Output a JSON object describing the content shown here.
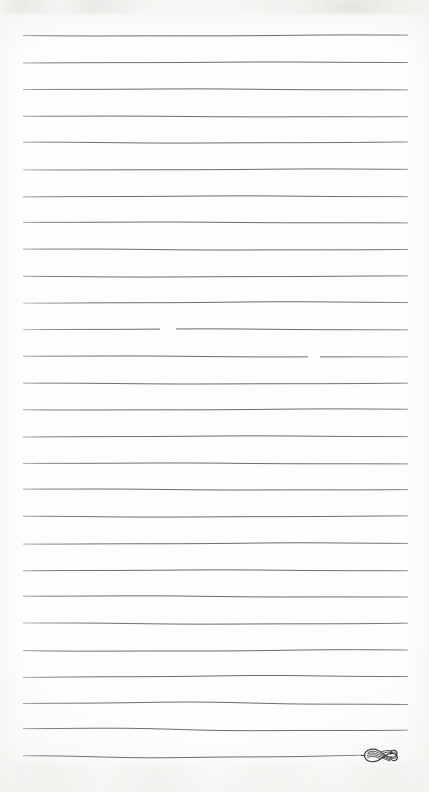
{
  "document": {
    "kind": "scanned-ruled-notepaper",
    "title": "Blank Ruled Notepaper Page",
    "page_width": 429,
    "page_height": 792,
    "background_color": "#fdfdfc",
    "paper_tint_color": "#f6f5f3",
    "text_content": "",
    "has_handwriting": false,
    "has_printed_text": false
  },
  "rules": {
    "count": 28,
    "color": "#585858",
    "stroke_width": 0.9,
    "left_x": 23,
    "right_x": 408,
    "first_y": 35,
    "spacing": 26.7,
    "lines": [
      {
        "index": 1,
        "y": 35,
        "left_x": 23,
        "right_x": 408,
        "wave": 0.5,
        "fade_left": 0.55,
        "fade_right": 0.7,
        "gap": null
      },
      {
        "index": 2,
        "y": 62,
        "left_x": 23,
        "right_x": 408,
        "wave": 0.4,
        "fade_left": 0.55,
        "fade_right": 0.7,
        "gap": null
      },
      {
        "index": 3,
        "y": 89,
        "left_x": 23,
        "right_x": 408,
        "wave": 0.5,
        "fade_left": 0.5,
        "fade_right": 0.7,
        "gap": null
      },
      {
        "index": 4,
        "y": 116,
        "left_x": 23,
        "right_x": 408,
        "wave": 0.4,
        "fade_left": 0.55,
        "fade_right": 0.65,
        "gap": null
      },
      {
        "index": 5,
        "y": 142,
        "left_x": 23,
        "right_x": 408,
        "wave": 0.5,
        "fade_left": 0.55,
        "fade_right": 0.7,
        "gap": null
      },
      {
        "index": 6,
        "y": 169,
        "left_x": 23,
        "right_x": 408,
        "wave": 0.45,
        "fade_left": 0.45,
        "fade_right": 0.7,
        "gap": null
      },
      {
        "index": 7,
        "y": 196,
        "left_x": 23,
        "right_x": 408,
        "wave": 0.5,
        "fade_left": 0.55,
        "fade_right": 0.7,
        "gap": null
      },
      {
        "index": 8,
        "y": 222,
        "left_x": 23,
        "right_x": 408,
        "wave": 0.4,
        "fade_left": 0.55,
        "fade_right": 0.7,
        "gap": null
      },
      {
        "index": 9,
        "y": 249,
        "left_x": 23,
        "right_x": 408,
        "wave": 0.5,
        "fade_left": 0.55,
        "fade_right": 0.7,
        "gap": null
      },
      {
        "index": 10,
        "y": 276,
        "left_x": 23,
        "right_x": 408,
        "wave": 0.45,
        "fade_left": 0.55,
        "fade_right": 0.7,
        "gap": null
      },
      {
        "index": 11,
        "y": 302,
        "left_x": 23,
        "right_x": 408,
        "wave": 0.6,
        "fade_left": 0.35,
        "fade_right": 0.7,
        "gap": null
      },
      {
        "index": 12,
        "y": 329,
        "left_x": 23,
        "right_x": 408,
        "wave": 0.5,
        "fade_left": 0.4,
        "fade_right": 0.6,
        "gap": {
          "start_x": 160,
          "end_x": 176
        }
      },
      {
        "index": 13,
        "y": 356,
        "left_x": 23,
        "right_x": 408,
        "wave": 0.5,
        "fade_left": 0.5,
        "fade_right": 0.55,
        "gap": {
          "start_x": 308,
          "end_x": 320
        }
      },
      {
        "index": 14,
        "y": 383,
        "left_x": 23,
        "right_x": 408,
        "wave": 0.45,
        "fade_left": 0.55,
        "fade_right": 0.7,
        "gap": null
      },
      {
        "index": 15,
        "y": 409,
        "left_x": 23,
        "right_x": 408,
        "wave": 0.5,
        "fade_left": 0.55,
        "fade_right": 0.7,
        "gap": null
      },
      {
        "index": 16,
        "y": 436,
        "left_x": 23,
        "right_x": 408,
        "wave": 0.5,
        "fade_left": 0.55,
        "fade_right": 0.7,
        "gap": null
      },
      {
        "index": 17,
        "y": 463,
        "left_x": 23,
        "right_x": 408,
        "wave": 0.45,
        "fade_left": 0.5,
        "fade_right": 0.7,
        "gap": null
      },
      {
        "index": 18,
        "y": 489,
        "left_x": 23,
        "right_x": 408,
        "wave": 0.5,
        "fade_left": 0.55,
        "fade_right": 0.7,
        "gap": null
      },
      {
        "index": 19,
        "y": 516,
        "left_x": 23,
        "right_x": 408,
        "wave": 0.5,
        "fade_left": 0.55,
        "fade_right": 0.7,
        "gap": null
      },
      {
        "index": 20,
        "y": 543,
        "left_x": 23,
        "right_x": 408,
        "wave": 0.55,
        "fade_left": 0.5,
        "fade_right": 0.7,
        "gap": null
      },
      {
        "index": 21,
        "y": 570,
        "left_x": 23,
        "right_x": 408,
        "wave": 0.5,
        "fade_left": 0.55,
        "fade_right": 0.7,
        "gap": null
      },
      {
        "index": 22,
        "y": 596,
        "left_x": 23,
        "right_x": 408,
        "wave": 0.6,
        "fade_left": 0.55,
        "fade_right": 0.7,
        "gap": null
      },
      {
        "index": 23,
        "y": 623,
        "left_x": 23,
        "right_x": 408,
        "wave": 0.6,
        "fade_left": 0.4,
        "fade_right": 0.7,
        "gap": null
      },
      {
        "index": 24,
        "y": 650,
        "left_x": 23,
        "right_x": 408,
        "wave": 0.7,
        "fade_left": 0.55,
        "fade_right": 0.7,
        "gap": null
      },
      {
        "index": 25,
        "y": 676,
        "left_x": 23,
        "right_x": 408,
        "wave": 0.8,
        "fade_left": 0.5,
        "fade_right": 0.7,
        "gap": null
      },
      {
        "index": 26,
        "y": 703,
        "left_x": 23,
        "right_x": 408,
        "wave": 1.2,
        "fade_left": 0.55,
        "fade_right": 0.7,
        "gap": null
      },
      {
        "index": 27,
        "y": 729,
        "left_x": 23,
        "right_x": 408,
        "wave": 1.3,
        "fade_left": 0.55,
        "fade_right": 0.7,
        "gap": null
      },
      {
        "index": 28,
        "y": 756,
        "left_x": 23,
        "right_x": 363,
        "wave": 1.1,
        "fade_left": 0.55,
        "fade_right": 0.6,
        "gap": null
      }
    ]
  },
  "ornament": {
    "name": "calligraphic-swash-flourish",
    "description": "Hatched double-curl swash terminating the final rule",
    "x": 361,
    "y": 743,
    "width": 48,
    "height": 24,
    "color": "#3b3b3b"
  }
}
